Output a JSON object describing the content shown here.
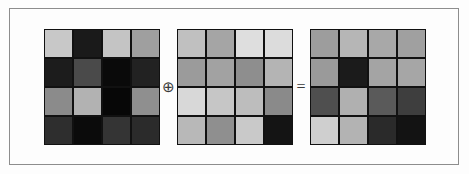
{
  "figure": {
    "background_color": "#fdfdfd",
    "border_color": "#8d8d8d",
    "grid_line_color": "#111111"
  },
  "operators": {
    "xor_symbol": "⊕",
    "equals_symbol": "=",
    "xor_name": "circled-plus-icon",
    "equals_name": "equals-icon"
  },
  "chart_data": {
    "type": "heatmap",
    "title": "",
    "xlabel": "",
    "ylabel": "",
    "grid": false,
    "legend": "none",
    "panels": [
      {
        "name": "operand-a",
        "rows": 4,
        "cols": 4,
        "colors": [
          [
            "#c8c8c8",
            "#1a1a1a",
            "#c4c4c4",
            "#9f9f9f"
          ],
          [
            "#1c1c1c",
            "#4a4a4a",
            "#0a0a0a",
            "#222222"
          ],
          [
            "#8b8b8b",
            "#b2b2b2",
            "#070707",
            "#8f8f8f"
          ],
          [
            "#2e2e2e",
            "#0b0b0b",
            "#343434",
            "#2b2b2b"
          ]
        ]
      },
      {
        "name": "operand-b",
        "rows": 4,
        "cols": 4,
        "colors": [
          [
            "#c0c0c0",
            "#a5a5a5",
            "#dedede",
            "#dcdcdc"
          ],
          [
            "#9b9b9b",
            "#a2a2a2",
            "#8e8e8e",
            "#b4b4b4"
          ],
          [
            "#d8d8d8",
            "#c6c6c6",
            "#bdbdbd",
            "#8a8a8a"
          ],
          [
            "#b8b8b8",
            "#8f8f8f",
            "#c9c9c9",
            "#141414"
          ]
        ]
      },
      {
        "name": "result",
        "rows": 4,
        "cols": 4,
        "colors": [
          [
            "#9d9d9d",
            "#b6b6b6",
            "#a8a8a8",
            "#a0a0a0"
          ],
          [
            "#9a9a9a",
            "#1b1b1b",
            "#a4a4a4",
            "#a6a6a6"
          ],
          [
            "#4f4f4f",
            "#b0b0b0",
            "#5a5a5a",
            "#3e3e3e"
          ],
          [
            "#cfcfcf",
            "#b3b3b3",
            "#2a2a2a",
            "#131313"
          ]
        ]
      }
    ]
  }
}
